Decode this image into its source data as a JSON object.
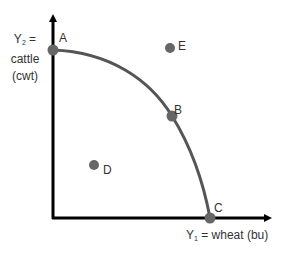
{
  "diagram": {
    "type": "production-possibilities-frontier",
    "y_axis": {
      "var": "Y",
      "sub": "2",
      "eq": " =",
      "line2": "cattle",
      "line3": "(cwt)"
    },
    "x_axis": {
      "var": "Y",
      "sub": "1",
      "rest": " = wheat (bu)"
    },
    "points": [
      {
        "id": "A",
        "label": "A",
        "on_curve": true
      },
      {
        "id": "B",
        "label": "B",
        "on_curve": true
      },
      {
        "id": "C",
        "label": "C",
        "on_curve": true
      },
      {
        "id": "D",
        "label": "D",
        "on_curve": false,
        "region": "inside"
      },
      {
        "id": "E",
        "label": "E",
        "on_curve": false,
        "region": "outside"
      }
    ],
    "colors": {
      "axis": "#000000",
      "curve": "#555555",
      "point": "#666666",
      "text": "#333333"
    }
  }
}
